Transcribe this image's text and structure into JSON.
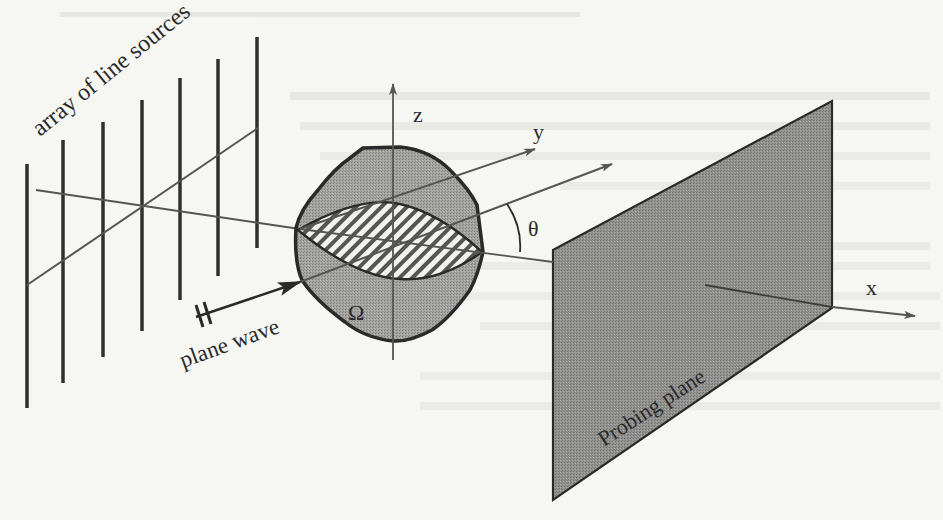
{
  "figure": {
    "type": "scattering-geometry-diagram",
    "background_color": "#f6f6f3",
    "ink_color": "#2a2a2a",
    "fill_gray": "#9c9c9a",
    "plane_gray": "#8e8e8c"
  },
  "labels": {
    "array": "array of line sources",
    "plane_wave": "plane wave",
    "omega": "Ω",
    "z_axis": "z",
    "y_axis": "y",
    "x_axis": "x",
    "theta": "θ",
    "probing_plane": "Probing plane"
  },
  "line_sources": {
    "count": 7,
    "bars": [
      {
        "x": 27,
        "top": 164,
        "bottom": 408
      },
      {
        "x": 63,
        "top": 140,
        "bottom": 383
      },
      {
        "x": 103,
        "top": 122,
        "bottom": 357
      },
      {
        "x": 142,
        "top": 100,
        "bottom": 331
      },
      {
        "x": 180,
        "top": 78,
        "bottom": 300
      },
      {
        "x": 218,
        "top": 59,
        "bottom": 276
      },
      {
        "x": 257,
        "top": 37,
        "bottom": 248
      }
    ]
  },
  "axes": {
    "z": {
      "from": [
        393,
        360
      ],
      "to": [
        393,
        82
      ]
    },
    "y": {
      "from": [
        27,
        285
      ],
      "to": [
        535,
        148
      ]
    },
    "x": {
      "from": [
        36,
        190
      ],
      "to": [
        915,
        316
      ]
    },
    "incident": {
      "from": [
        470,
        216
      ],
      "to": [
        612,
        165
      ]
    }
  },
  "object": {
    "name": "Ω",
    "outline": "scatterer boundary",
    "inner_region": "hatched elliptical cross-section"
  },
  "probing_plane": {
    "vertices": [
      [
        553,
        250
      ],
      [
        832,
        101
      ],
      [
        832,
        308
      ],
      [
        553,
        500
      ]
    ]
  }
}
